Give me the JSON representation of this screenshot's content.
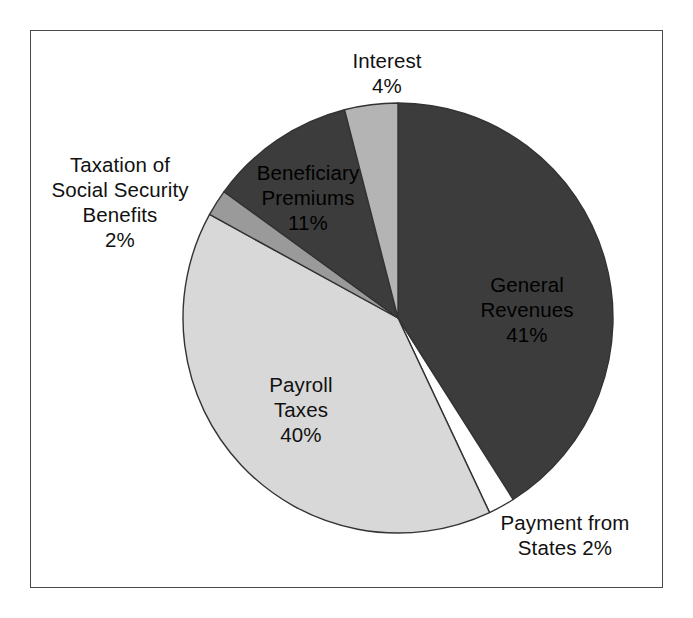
{
  "chart_data": {
    "type": "pie",
    "title": "",
    "subtitle": "",
    "xlabel": "",
    "ylabel": "",
    "legend_position": "none",
    "grid": false,
    "units": "percent",
    "total": 100,
    "start_angle_deg": 0,
    "direction": "clockwise",
    "categories": [
      "General Revenues",
      "Payment from States",
      "Payroll Taxes",
      "Taxation of Social Security Benefits",
      "Beneficiary Premiums",
      "Interest"
    ],
    "values": [
      41,
      2,
      40,
      2,
      11,
      4
    ],
    "slices": [
      {
        "name": "General Revenues",
        "value": 41,
        "value_label": "41%",
        "label_lines": [
          "General",
          "Revenues",
          "41%"
        ],
        "color": "#3c3c3c",
        "label_placement": "inside",
        "start_deg": 0,
        "end_deg": 147.6
      },
      {
        "name": "Payment from States",
        "value": 2,
        "value_label": "2%",
        "label_lines": [
          "Payment from",
          "States 2%"
        ],
        "color": "#ffffff",
        "label_placement": "outside",
        "start_deg": 147.6,
        "end_deg": 154.8
      },
      {
        "name": "Payroll Taxes",
        "value": 40,
        "value_label": "40%",
        "label_lines": [
          "Payroll",
          "Taxes",
          "40%"
        ],
        "color": "#d8d8d8",
        "label_placement": "inside",
        "start_deg": 154.8,
        "end_deg": 298.8
      },
      {
        "name": "Taxation of Social Security Benefits",
        "value": 2,
        "value_label": "2%",
        "label_lines": [
          "Taxation of",
          "Social Security",
          "Benefits",
          "2%"
        ],
        "color": "#9a9a9a",
        "label_placement": "outside",
        "start_deg": 298.8,
        "end_deg": 306.0
      },
      {
        "name": "Beneficiary Premiums",
        "value": 11,
        "value_label": "11%",
        "label_lines": [
          "Beneficiary",
          "Premiums",
          "11%"
        ],
        "color": "#3c3c3c",
        "label_placement": "inside",
        "start_deg": 306.0,
        "end_deg": 345.6
      },
      {
        "name": "Interest",
        "value": 4,
        "value_label": "4%",
        "label_lines": [
          "Interest",
          "4%"
        ],
        "color": "#b4b4b4",
        "label_placement": "outside",
        "start_deg": 345.6,
        "end_deg": 360.0
      }
    ],
    "colors": {
      "dark_gray": "#3c3c3c",
      "medium_gray": "#9a9a9a",
      "light_gray": "#d8d8d8",
      "mid_light_gray": "#b4b4b4",
      "white": "#ffffff",
      "outline": "#333333",
      "frame": "#4a4a4a",
      "text": "#111111",
      "background": "#ffffff"
    },
    "geometry": {
      "center_x": 398,
      "center_y": 318,
      "radius": 215
    }
  }
}
